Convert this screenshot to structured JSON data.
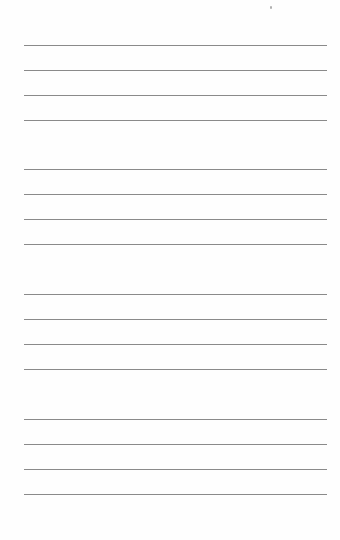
{
  "page": {
    "type": "lined-paper",
    "background": "#ffffff",
    "rule_color": "#8a8a8a",
    "groups": [
      {
        "lines": [
          45,
          70,
          95,
          120
        ]
      },
      {
        "lines": [
          169,
          194,
          219,
          244
        ]
      },
      {
        "lines": [
          294,
          319,
          344,
          369
        ]
      },
      {
        "lines": [
          419,
          444,
          469,
          494
        ]
      }
    ]
  }
}
